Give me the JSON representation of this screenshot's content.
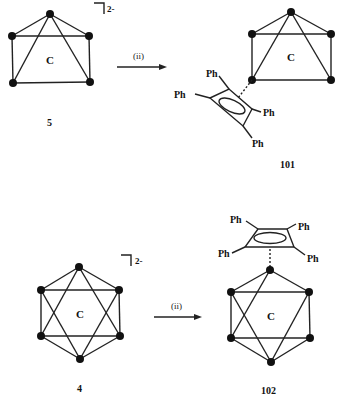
{
  "diagram": {
    "type": "chemical-reaction-scheme",
    "reactions": [
      {
        "reactant": {
          "label": "5",
          "center_atom": "C",
          "charge": "2-"
        },
        "condition": "(ii)",
        "product": {
          "label": "101",
          "center_atom": "C",
          "substituents": [
            "Ph",
            "Ph",
            "Ph",
            "Ph"
          ]
        }
      },
      {
        "reactant": {
          "label": "4",
          "center_atom": "C",
          "charge": "2-"
        },
        "condition": "(ii)",
        "product": {
          "label": "102",
          "center_atom": "C",
          "substituents": [
            "Ph",
            "Ph",
            "Ph",
            "Ph"
          ]
        }
      }
    ]
  },
  "labels": {
    "r1_reactant_num": "5",
    "r1_product_num": "101",
    "r1_center": "C",
    "r1_prod_center": "C",
    "r1_charge": "2-",
    "r1_cond": "(ii)",
    "r2_reactant_num": "4",
    "r2_product_num": "102",
    "r2_center": "C",
    "r2_prod_center": "C",
    "r2_charge": "2-",
    "r2_cond": "(ii)",
    "ph": "Ph"
  }
}
